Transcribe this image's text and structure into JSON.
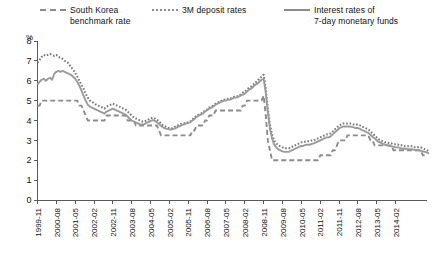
{
  "chart_data": {
    "type": "line",
    "title": "",
    "subtitle": "",
    "xlabel": "",
    "ylabel": "%",
    "unit_label": "%",
    "ylim": [
      0,
      8
    ],
    "yticks": [
      0,
      1,
      2,
      3,
      4,
      5,
      6,
      7,
      8
    ],
    "grid": false,
    "legend_position": "top",
    "x_start": "1999-11",
    "x_end": "2014-11",
    "x_step_months": 1,
    "tick_labels": [
      "1999-11",
      "2000-08",
      "2001-05",
      "2002-02",
      "2002-11",
      "2003-08",
      "2004-05",
      "2005-02",
      "2005-11",
      "2006-08",
      "2007-05",
      "2008-02",
      "2008-11",
      "2009-08",
      "2010-05",
      "2011-02",
      "2011-11",
      "2012-08",
      "2013-05",
      "2014-02"
    ],
    "tick_step_months": 9,
    "series": [
      {
        "name": "South Korea\nbenchmark rate",
        "style": "dashed",
        "color": "#8c8c8c",
        "values": [
          4.75,
          4.75,
          5.0,
          5.0,
          5.0,
          5.0,
          5.0,
          5.0,
          5.0,
          5.0,
          5.0,
          5.0,
          5.0,
          5.0,
          5.0,
          5.0,
          5.0,
          5.0,
          5.0,
          5.0,
          4.75,
          4.75,
          4.5,
          4.25,
          4.0,
          4.0,
          4.0,
          4.0,
          4.0,
          4.0,
          4.0,
          4.0,
          4.0,
          4.25,
          4.25,
          4.25,
          4.25,
          4.25,
          4.25,
          4.25,
          4.25,
          4.25,
          4.25,
          4.0,
          4.0,
          4.0,
          4.0,
          3.75,
          3.75,
          3.75,
          3.75,
          3.75,
          3.75,
          3.75,
          3.75,
          3.75,
          3.75,
          3.75,
          3.5,
          3.25,
          3.25,
          3.25,
          3.25,
          3.25,
          3.25,
          3.25,
          3.25,
          3.25,
          3.25,
          3.25,
          3.25,
          3.25,
          3.25,
          3.25,
          3.5,
          3.5,
          3.75,
          3.75,
          3.75,
          3.75,
          4.0,
          4.0,
          4.25,
          4.25,
          4.25,
          4.5,
          4.5,
          4.5,
          4.5,
          4.5,
          4.5,
          4.5,
          4.5,
          4.5,
          4.5,
          4.5,
          4.5,
          4.5,
          4.75,
          4.75,
          5.0,
          5.0,
          5.0,
          5.0,
          5.0,
          5.0,
          5.0,
          5.0,
          5.25,
          4.25,
          3.0,
          2.5,
          2.0,
          2.0,
          2.0,
          2.0,
          2.0,
          2.0,
          2.0,
          2.0,
          2.0,
          2.0,
          2.0,
          2.0,
          2.0,
          2.0,
          2.0,
          2.0,
          2.0,
          2.0,
          2.0,
          2.0,
          2.0,
          2.0,
          2.0,
          2.25,
          2.25,
          2.25,
          2.25,
          2.25,
          2.25,
          2.5,
          2.5,
          2.75,
          3.0,
          3.0,
          3.0,
          3.0,
          3.25,
          3.25,
          3.25,
          3.25,
          3.25,
          3.25,
          3.25,
          3.25,
          3.25,
          3.25,
          3.25,
          3.0,
          3.0,
          2.75,
          2.75,
          2.75,
          2.75,
          2.75,
          2.75,
          2.75,
          2.75,
          2.75,
          2.5,
          2.5,
          2.5,
          2.5,
          2.5,
          2.5,
          2.5,
          2.5,
          2.5,
          2.5,
          2.5,
          2.5,
          2.5,
          2.5,
          2.25,
          2.25,
          2.25
        ]
      },
      {
        "name": "3M deposit rates",
        "style": "dotted",
        "color": "#777777",
        "values": [
          6.9,
          7.05,
          7.2,
          7.3,
          7.25,
          7.3,
          7.35,
          7.3,
          7.25,
          7.3,
          7.2,
          7.15,
          7.1,
          7.0,
          6.95,
          6.85,
          6.7,
          6.55,
          6.4,
          6.2,
          6.0,
          5.8,
          5.6,
          5.35,
          5.15,
          5.0,
          4.95,
          4.85,
          4.8,
          4.75,
          4.7,
          4.65,
          4.6,
          4.7,
          4.75,
          4.8,
          4.85,
          4.8,
          4.75,
          4.7,
          4.65,
          4.6,
          4.55,
          4.45,
          4.35,
          4.25,
          4.15,
          4.1,
          4.05,
          4.0,
          3.95,
          3.95,
          4.0,
          4.05,
          4.1,
          4.15,
          4.1,
          4.05,
          3.95,
          3.85,
          3.75,
          3.7,
          3.65,
          3.6,
          3.6,
          3.65,
          3.7,
          3.75,
          3.8,
          3.85,
          3.85,
          3.9,
          3.9,
          3.95,
          4.05,
          4.15,
          4.25,
          4.3,
          4.35,
          4.4,
          4.5,
          4.55,
          4.65,
          4.7,
          4.75,
          4.85,
          4.9,
          4.95,
          5.0,
          5.05,
          5.05,
          5.1,
          5.1,
          5.15,
          5.2,
          5.2,
          5.25,
          5.3,
          5.4,
          5.45,
          5.55,
          5.65,
          5.7,
          5.8,
          5.9,
          6.0,
          6.1,
          6.2,
          6.3,
          5.6,
          4.6,
          3.8,
          3.3,
          3.0,
          2.85,
          2.75,
          2.7,
          2.65,
          2.6,
          2.6,
          2.6,
          2.65,
          2.7,
          2.75,
          2.8,
          2.85,
          2.9,
          2.9,
          2.95,
          2.95,
          2.95,
          3.0,
          3.0,
          3.05,
          3.1,
          3.15,
          3.2,
          3.25,
          3.3,
          3.3,
          3.35,
          3.45,
          3.55,
          3.65,
          3.75,
          3.8,
          3.85,
          3.85,
          3.85,
          3.85,
          3.85,
          3.8,
          3.8,
          3.8,
          3.75,
          3.7,
          3.65,
          3.6,
          3.55,
          3.45,
          3.35,
          3.25,
          3.15,
          3.05,
          3.0,
          2.95,
          2.9,
          2.9,
          2.85,
          2.85,
          2.8,
          2.8,
          2.8,
          2.75,
          2.75,
          2.7,
          2.7,
          2.7,
          2.7,
          2.7,
          2.65,
          2.65,
          2.65,
          2.65,
          2.6,
          2.55,
          2.5,
          2.45
        ]
      },
      {
        "name": "Interest rates of\n7-day monetary funds",
        "style": "solid",
        "color": "#9b9b9b",
        "values": [
          5.8,
          5.95,
          6.05,
          6.1,
          6.0,
          6.1,
          6.15,
          6.05,
          6.35,
          6.45,
          6.5,
          6.45,
          6.5,
          6.45,
          6.4,
          6.35,
          6.3,
          6.2,
          6.1,
          5.95,
          5.75,
          5.5,
          5.25,
          5.0,
          4.8,
          4.7,
          4.65,
          4.6,
          4.55,
          4.5,
          4.45,
          4.4,
          4.35,
          4.45,
          4.5,
          4.55,
          4.6,
          4.55,
          4.5,
          4.45,
          4.4,
          4.35,
          4.3,
          4.2,
          4.1,
          4.0,
          3.95,
          3.9,
          3.85,
          3.8,
          3.8,
          3.82,
          3.88,
          3.92,
          3.98,
          4.02,
          3.98,
          3.92,
          3.82,
          3.72,
          3.65,
          3.6,
          3.58,
          3.55,
          3.55,
          3.58,
          3.62,
          3.68,
          3.72,
          3.78,
          3.8,
          3.85,
          3.88,
          3.92,
          4.0,
          4.08,
          4.18,
          4.25,
          4.3,
          4.35,
          4.45,
          4.52,
          4.6,
          4.65,
          4.7,
          4.8,
          4.85,
          4.9,
          4.95,
          5.0,
          5.0,
          5.05,
          5.05,
          5.1,
          5.15,
          5.15,
          5.2,
          5.25,
          5.3,
          5.35,
          5.45,
          5.55,
          5.6,
          5.7,
          5.8,
          5.85,
          5.95,
          6.05,
          6.1,
          5.4,
          4.4,
          3.6,
          3.1,
          2.8,
          2.65,
          2.55,
          2.5,
          2.45,
          2.42,
          2.42,
          2.42,
          2.48,
          2.52,
          2.58,
          2.62,
          2.68,
          2.72,
          2.72,
          2.78,
          2.78,
          2.78,
          2.82,
          2.85,
          2.9,
          2.95,
          3.0,
          3.05,
          3.1,
          3.15,
          3.15,
          3.2,
          3.3,
          3.4,
          3.5,
          3.6,
          3.65,
          3.7,
          3.7,
          3.7,
          3.7,
          3.68,
          3.65,
          3.62,
          3.62,
          3.58,
          3.52,
          3.48,
          3.42,
          3.38,
          3.28,
          3.18,
          3.1,
          3.0,
          2.92,
          2.88,
          2.82,
          2.78,
          2.75,
          2.72,
          2.7,
          2.68,
          2.65,
          2.65,
          2.62,
          2.6,
          2.58,
          2.58,
          2.55,
          2.55,
          2.55,
          2.52,
          2.5,
          2.5,
          2.48,
          2.45,
          2.42,
          2.38,
          2.35
        ]
      }
    ]
  },
  "legend": {
    "items": [
      {
        "label": "South Korea\nbenchmark rate",
        "style": "dashed",
        "color": "#8c8c8c"
      },
      {
        "label": "3M deposit rates",
        "style": "dotted",
        "color": "#777777"
      },
      {
        "label": "Interest rates of\n7-day monetary funds",
        "style": "solid",
        "color": "#9b9b9b"
      }
    ]
  },
  "axis": {
    "unit": "%"
  }
}
